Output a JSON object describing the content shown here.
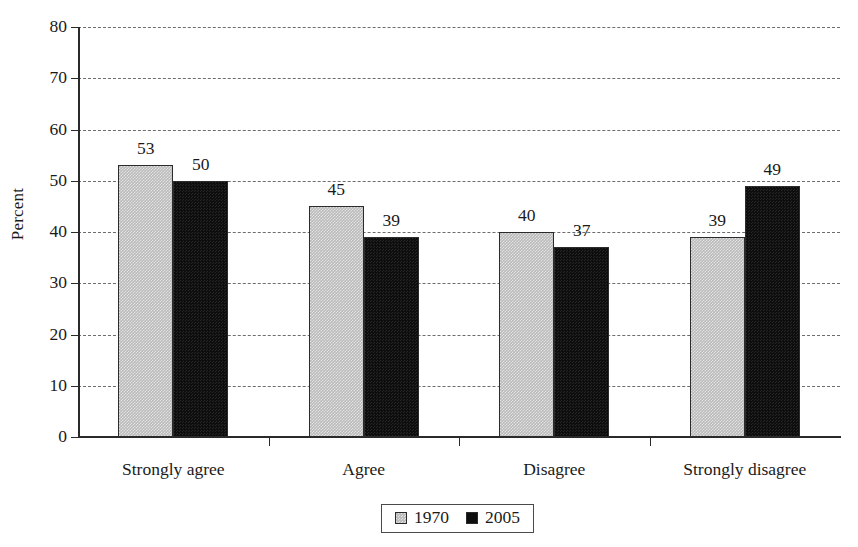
{
  "chart_data": {
    "type": "bar",
    "title": "",
    "xlabel": "",
    "ylabel": "Percent",
    "categories": [
      "Strongly agree",
      "Agree",
      "Disagree",
      "Strongly disagree"
    ],
    "series": [
      {
        "name": "1970",
        "values": [
          53,
          45,
          40,
          39
        ],
        "color": "#bdbdbd"
      },
      {
        "name": "2005",
        "values": [
          50,
          39,
          37,
          49
        ],
        "color": "#0e0e0e"
      }
    ],
    "ylim": [
      0,
      80
    ],
    "ytick_step": 10,
    "yticks": [
      0,
      10,
      20,
      30,
      40,
      50,
      60,
      70,
      80
    ],
    "ytick_labels": [
      "0",
      "10",
      "20",
      "30",
      "40",
      "50",
      "60",
      "70",
      "80"
    ],
    "grid": "horizontal-dashed",
    "legend_position": "bottom-center",
    "data_labels": true
  },
  "legend": {
    "items": [
      {
        "label": "1970",
        "swatch": "legend-swatch-gray"
      },
      {
        "label": "2005",
        "swatch": "legend-swatch-black"
      }
    ]
  }
}
